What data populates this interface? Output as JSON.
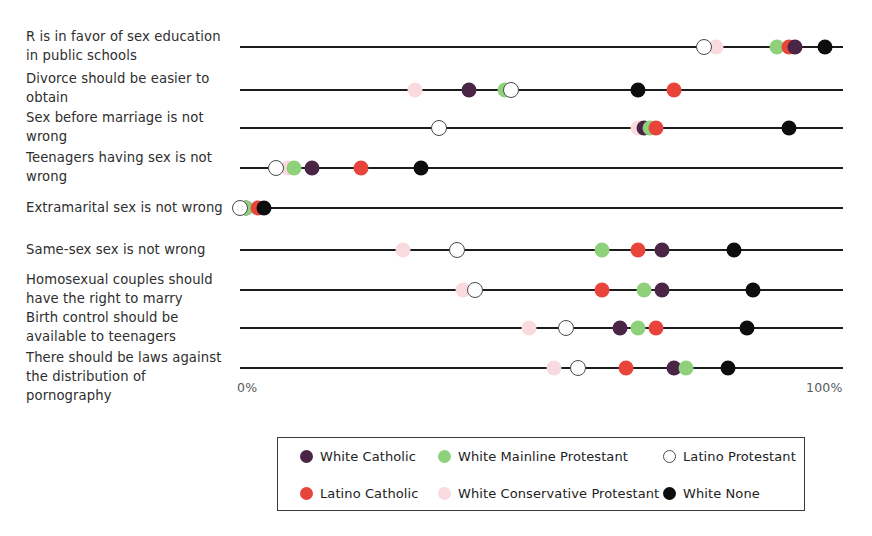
{
  "axis": {
    "min_label": "0%",
    "max_label": "100%",
    "min_value": 0,
    "max_value": 100
  },
  "legend": {
    "items": [
      {
        "label": "White Catholic",
        "key": "white_catholic",
        "color": "#4a2545",
        "style": "filled",
        "row": 0,
        "col": 0
      },
      {
        "label": "Latino Catholic",
        "key": "latino_catholic",
        "color": "#e8443c",
        "style": "filled",
        "row": 1,
        "col": 0
      },
      {
        "label": "White Mainline Protestant",
        "key": "white_mainline_protestant",
        "color": "#8fd07a",
        "style": "filled",
        "row": 0,
        "col": 1
      },
      {
        "label": "White Conservative Protestant",
        "key": "white_conservative_protestant",
        "color": "#f9dade",
        "style": "filled",
        "row": 1,
        "col": 1
      },
      {
        "label": "Latino Protestant",
        "key": "latino_protestant",
        "color": "#ffffff",
        "style": "open",
        "row": 0,
        "col": 2
      },
      {
        "label": "White None",
        "key": "white_none",
        "color": "#0d0d0d",
        "style": "filled",
        "row": 1,
        "col": 2
      }
    ]
  },
  "chart_data": {
    "type": "scatter",
    "title": "",
    "xlabel": "",
    "ylabel": "",
    "xlim": [
      0,
      100
    ],
    "grid": false,
    "legend_position": "bottom",
    "tick_labels": [
      "0%",
      "100%"
    ],
    "categories": [
      "R is in favor of sex education in public schools",
      "Divorce should be easier to obtain",
      "Sex before marriage is not wrong",
      "Teenagers having sex is not wrong",
      "Extramarital sex is not wrong",
      "Same-sex sex is not wrong",
      "Homosexual couples should have the right to marry",
      "Birth control should be available to teenagers",
      "There should be laws against the distribution of pornography"
    ],
    "series": [
      {
        "name": "White Catholic",
        "key": "white_catholic",
        "color": "#4a2545",
        "style": "filled",
        "values": [
          92,
          38,
          67,
          12,
          1,
          70,
          70,
          63,
          72
        ]
      },
      {
        "name": "Latino Catholic",
        "key": "latino_catholic",
        "color": "#e8443c",
        "style": "filled",
        "values": [
          91,
          72,
          69,
          20,
          3,
          66,
          60,
          69,
          64
        ]
      },
      {
        "name": "White Mainline Protestant",
        "key": "white_mainline_protestant",
        "color": "#8fd07a",
        "style": "filled",
        "values": [
          89,
          44,
          68,
          9,
          1,
          60,
          67,
          66,
          74
        ]
      },
      {
        "name": "White Conservative Protestant",
        "key": "white_conservative_protestant",
        "color": "#f9dade",
        "style": "filled",
        "values": [
          79,
          29,
          67,
          8,
          0,
          27,
          37,
          48,
          52
        ]
      },
      {
        "name": "Latino Protestant",
        "key": "latino_protestant",
        "color": "#ffffff",
        "style": "open",
        "values": [
          77,
          45,
          33,
          6,
          0,
          36,
          39,
          54,
          56
        ]
      },
      {
        "name": "White None",
        "key": "white_none",
        "color": "#0d0d0d",
        "style": "filled",
        "values": [
          97,
          66,
          91,
          30,
          4,
          82,
          85,
          84,
          81
        ]
      }
    ],
    "rows": [
      {
        "label": "R is in favor of sex education\nin public schools",
        "label_top": 27,
        "line_y": 47,
        "points": [
          {
            "key": "latino_protestant",
            "x": 77,
            "style": "open",
            "color": "#ffffff"
          },
          {
            "key": "white_conservative_protestant",
            "x": 79,
            "style": "filled",
            "color": "#f9dade"
          },
          {
            "key": "white_mainline_protestant",
            "x": 89,
            "style": "filled",
            "color": "#8fd07a"
          },
          {
            "key": "latino_catholic",
            "x": 91,
            "style": "filled",
            "color": "#e8443c"
          },
          {
            "key": "white_catholic",
            "x": 92,
            "style": "filled",
            "color": "#4a2545"
          },
          {
            "key": "white_none",
            "x": 97,
            "style": "filled",
            "color": "#0d0d0d"
          }
        ]
      },
      {
        "label": "Divorce should be easier to\nobtain",
        "label_top": 69,
        "line_y": 90,
        "points": [
          {
            "key": "white_conservative_protestant",
            "x": 29,
            "style": "filled",
            "color": "#f9dade"
          },
          {
            "key": "white_catholic",
            "x": 38,
            "style": "filled",
            "color": "#4a2545"
          },
          {
            "key": "white_mainline_protestant",
            "x": 44,
            "style": "filled",
            "color": "#8fd07a"
          },
          {
            "key": "latino_protestant",
            "x": 45,
            "style": "open",
            "color": "#ffffff"
          },
          {
            "key": "white_none",
            "x": 66,
            "style": "filled",
            "color": "#0d0d0d"
          },
          {
            "key": "latino_catholic",
            "x": 72,
            "style": "filled",
            "color": "#e8443c"
          }
        ]
      },
      {
        "label": "Sex before marriage is not\nwrong",
        "label_top": 108,
        "line_y": 128,
        "points": [
          {
            "key": "latino_protestant",
            "x": 33,
            "style": "open",
            "color": "#ffffff"
          },
          {
            "key": "white_conservative_protestant",
            "x": 66,
            "style": "filled",
            "color": "#f9dade"
          },
          {
            "key": "white_catholic",
            "x": 67,
            "style": "filled",
            "color": "#4a2545"
          },
          {
            "key": "white_mainline_protestant",
            "x": 68,
            "style": "filled",
            "color": "#8fd07a"
          },
          {
            "key": "latino_catholic",
            "x": 69,
            "style": "filled",
            "color": "#e8443c"
          },
          {
            "key": "white_none",
            "x": 91,
            "style": "filled",
            "color": "#0d0d0d"
          }
        ]
      },
      {
        "label": "Teenagers having sex is not\nwrong",
        "label_top": 148,
        "line_y": 168,
        "points": [
          {
            "key": "latino_protestant",
            "x": 6,
            "style": "open",
            "color": "#ffffff"
          },
          {
            "key": "white_conservative_protestant",
            "x": 8,
            "style": "filled",
            "color": "#f9dade"
          },
          {
            "key": "white_mainline_protestant",
            "x": 9,
            "style": "filled",
            "color": "#8fd07a"
          },
          {
            "key": "white_catholic",
            "x": 12,
            "style": "filled",
            "color": "#4a2545"
          },
          {
            "key": "latino_catholic",
            "x": 20,
            "style": "filled",
            "color": "#e8443c"
          },
          {
            "key": "white_none",
            "x": 30,
            "style": "filled",
            "color": "#0d0d0d"
          }
        ]
      },
      {
        "label": "Extramarital sex is not wrong",
        "label_top": 198,
        "line_y": 208,
        "points": [
          {
            "key": "white_conservative_protestant",
            "x": 0,
            "style": "filled",
            "color": "#f9dade"
          },
          {
            "key": "latino_protestant",
            "x": 0,
            "style": "open",
            "color": "#ffffff"
          },
          {
            "key": "white_catholic",
            "x": 1,
            "style": "filled",
            "color": "#4a2545"
          },
          {
            "key": "white_mainline_protestant",
            "x": 1,
            "style": "filled",
            "color": "#8fd07a"
          },
          {
            "key": "latino_catholic",
            "x": 3,
            "style": "filled",
            "color": "#e8443c"
          },
          {
            "key": "white_none",
            "x": 4,
            "style": "filled",
            "color": "#0d0d0d"
          }
        ]
      },
      {
        "label": "Same-sex sex is not wrong",
        "label_top": 240,
        "line_y": 250,
        "points": [
          {
            "key": "white_conservative_protestant",
            "x": 27,
            "style": "filled",
            "color": "#f9dade"
          },
          {
            "key": "latino_protestant",
            "x": 36,
            "style": "open",
            "color": "#ffffff"
          },
          {
            "key": "white_mainline_protestant",
            "x": 60,
            "style": "filled",
            "color": "#8fd07a"
          },
          {
            "key": "latino_catholic",
            "x": 66,
            "style": "filled",
            "color": "#e8443c"
          },
          {
            "key": "white_catholic",
            "x": 70,
            "style": "filled",
            "color": "#4a2545"
          },
          {
            "key": "white_none",
            "x": 82,
            "style": "filled",
            "color": "#0d0d0d"
          }
        ]
      },
      {
        "label": "Homosexual couples should\nhave the right to marry",
        "label_top": 270,
        "line_y": 290,
        "points": [
          {
            "key": "white_conservative_protestant",
            "x": 37,
            "style": "filled",
            "color": "#f9dade"
          },
          {
            "key": "latino_protestant",
            "x": 39,
            "style": "open",
            "color": "#ffffff"
          },
          {
            "key": "latino_catholic",
            "x": 60,
            "style": "filled",
            "color": "#e8443c"
          },
          {
            "key": "white_mainline_protestant",
            "x": 67,
            "style": "filled",
            "color": "#8fd07a"
          },
          {
            "key": "white_catholic",
            "x": 70,
            "style": "filled",
            "color": "#4a2545"
          },
          {
            "key": "white_none",
            "x": 85,
            "style": "filled",
            "color": "#0d0d0d"
          }
        ]
      },
      {
        "label": "Birth control should be\navailable to teenagers",
        "label_top": 308,
        "line_y": 328,
        "points": [
          {
            "key": "white_conservative_protestant",
            "x": 48,
            "style": "filled",
            "color": "#f9dade"
          },
          {
            "key": "latino_protestant",
            "x": 54,
            "style": "open",
            "color": "#ffffff"
          },
          {
            "key": "white_catholic",
            "x": 63,
            "style": "filled",
            "color": "#4a2545"
          },
          {
            "key": "white_mainline_protestant",
            "x": 66,
            "style": "filled",
            "color": "#8fd07a"
          },
          {
            "key": "latino_catholic",
            "x": 69,
            "style": "filled",
            "color": "#e8443c"
          },
          {
            "key": "white_none",
            "x": 84,
            "style": "filled",
            "color": "#0d0d0d"
          }
        ]
      },
      {
        "label": "There should be laws against\nthe distribution of\npornography",
        "label_top": 348,
        "line_y": 368,
        "points": [
          {
            "key": "white_conservative_protestant",
            "x": 52,
            "style": "filled",
            "color": "#f9dade"
          },
          {
            "key": "latino_protestant",
            "x": 56,
            "style": "open",
            "color": "#ffffff"
          },
          {
            "key": "latino_catholic",
            "x": 64,
            "style": "filled",
            "color": "#e8443c"
          },
          {
            "key": "white_catholic",
            "x": 72,
            "style": "filled",
            "color": "#4a2545"
          },
          {
            "key": "white_mainline_protestant",
            "x": 74,
            "style": "filled",
            "color": "#8fd07a"
          },
          {
            "key": "white_none",
            "x": 81,
            "style": "filled",
            "color": "#0d0d0d"
          }
        ]
      }
    ]
  }
}
